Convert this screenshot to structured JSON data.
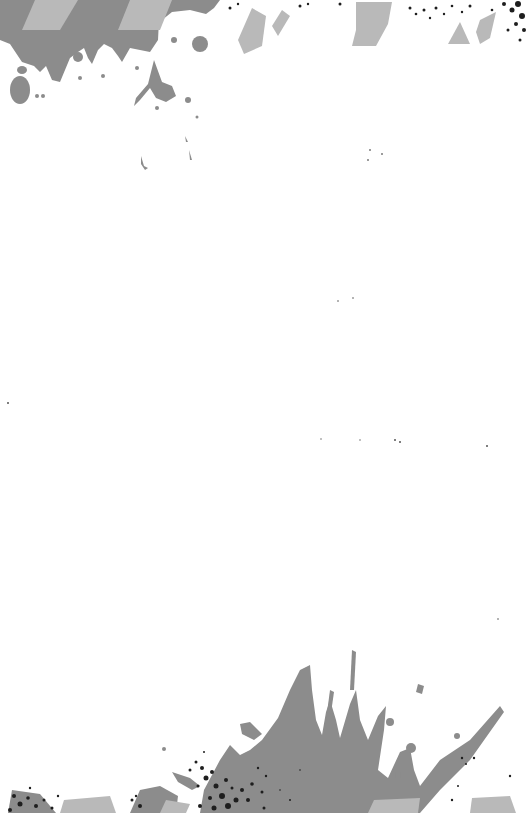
{
  "canvas": {
    "width": 528,
    "height": 813,
    "background": "#ffffff"
  },
  "palette": {
    "splatter_mid": "#8c8c8c",
    "splatter_light": "#b9b9b9",
    "speckle_dark": "#1e1e1e"
  },
  "decorations": {
    "top_splatter": "grunge-paint-splatter-top",
    "bottom_splatter": "grunge-paint-splatter-bottom"
  }
}
